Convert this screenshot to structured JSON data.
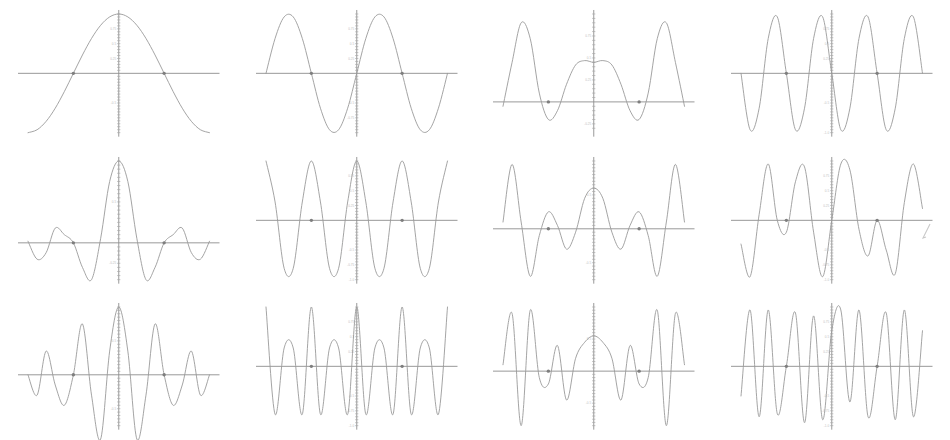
{
  "figure": {
    "title": "",
    "rows": 3,
    "columns": 4,
    "background_color": "#ffffff",
    "curve_color": "#9a9a9a",
    "axis_color": "#8d8d8d",
    "marker_color": "#7e7e7e",
    "ticklabel_color": "#c2c2c2",
    "stray_mark": {
      "name": "stray-pen-mark",
      "description": "small faint diagonal tick at far right of middle row"
    }
  },
  "chart_data": [
    {
      "type": "line",
      "title": "",
      "xlabel": "",
      "ylabel": "",
      "panel_index": 1,
      "row": 1,
      "column": 1,
      "function": "cos(x)",
      "harmonic": 1,
      "xlim": [
        -3.14159,
        3.14159
      ],
      "ylim": [
        -1.0,
        1.0
      ],
      "grid": false,
      "legend": null,
      "yticks": [
        -0.5,
        0.25,
        0.5,
        0.75
      ],
      "yticklabels": [
        "-0.5",
        "0.25",
        "0.5",
        "0.75"
      ],
      "markers": [
        {
          "x": -1.5708,
          "y": 0
        },
        {
          "x": 1.5708,
          "y": 0
        }
      ],
      "x": [
        -3.14159,
        -2.82743,
        -2.51327,
        -2.19911,
        -1.88496,
        -1.5708,
        -1.25664,
        -0.94248,
        -0.62832,
        -0.31416,
        0,
        0.31416,
        0.62832,
        0.94248,
        1.25664,
        1.5708,
        1.88496,
        2.19911,
        2.51327,
        2.82743,
        3.14159
      ],
      "values": [
        -1,
        -0.951,
        -0.809,
        -0.588,
        -0.309,
        0,
        0.309,
        0.588,
        0.809,
        0.951,
        1,
        0.951,
        0.809,
        0.588,
        0.309,
        0,
        -0.309,
        -0.588,
        -0.809,
        -0.951,
        -1
      ]
    },
    {
      "type": "line",
      "title": "",
      "xlabel": "",
      "ylabel": "",
      "panel_index": 2,
      "row": 1,
      "column": 2,
      "function": "sin(2x)",
      "harmonic": 2,
      "xlim": [
        -3.14159,
        3.14159
      ],
      "ylim": [
        -1.0,
        1.0
      ],
      "grid": false,
      "legend": null,
      "yticks": [
        -0.75,
        -0.5,
        0.25,
        0.5,
        0.75
      ],
      "yticklabels": [
        "-0.75",
        "-0.5",
        "0.25",
        "0.5",
        "0.75"
      ],
      "markers": [
        {
          "x": -1.5708,
          "y": 0
        },
        {
          "x": 1.5708,
          "y": 0
        }
      ],
      "x": [
        -3.14159,
        -2.82743,
        -2.51327,
        -2.19911,
        -1.88496,
        -1.5708,
        -1.25664,
        -0.94248,
        -0.62832,
        -0.31416,
        0,
        0.31416,
        0.62832,
        0.94248,
        1.25664,
        1.5708,
        1.88496,
        2.19911,
        2.51327,
        2.82743,
        3.14159
      ],
      "values": [
        0,
        0.588,
        0.951,
        0.951,
        0.588,
        0,
        -0.588,
        -0.951,
        -0.951,
        -0.588,
        0,
        0.588,
        0.951,
        0.951,
        0.588,
        0,
        -0.588,
        -0.951,
        -0.951,
        -0.588,
        0
      ]
    },
    {
      "type": "line",
      "title": "",
      "xlabel": "",
      "ylabel": "",
      "panel_index": 3,
      "row": 1,
      "column": 3,
      "function": "cos(3x)",
      "harmonic": 3,
      "xlim": [
        -3.14159,
        3.14159
      ],
      "ylim": [
        -0.35,
        1.0
      ],
      "grid": false,
      "legend": null,
      "yticks": [
        -0.25,
        0.25,
        0.5,
        0.75
      ],
      "yticklabels": [
        "-0.25",
        "0.25",
        "0.5",
        "0.75"
      ],
      "markers": [
        {
          "x": -1.5708,
          "y": 0
        },
        {
          "x": 1.5708,
          "y": 0
        }
      ],
      "x": [
        -3.14159,
        -2.82743,
        -2.51327,
        -2.19911,
        -1.88496,
        -1.5708,
        -1.25664,
        -0.94248,
        -0.62832,
        -0.31416,
        0,
        0.31416,
        0.62832,
        0.94248,
        1.25664,
        1.5708,
        1.88496,
        2.19911,
        2.51327,
        2.82743,
        3.14159
      ],
      "values": [
        -0.05,
        0.45,
        0.9,
        0.72,
        0.1,
        -0.2,
        -0.1,
        0.2,
        0.42,
        0.47,
        0.45,
        0.47,
        0.42,
        0.2,
        -0.1,
        -0.2,
        0.1,
        0.72,
        0.9,
        0.45,
        -0.05
      ]
    },
    {
      "type": "line",
      "title": "",
      "xlabel": "",
      "ylabel": "",
      "panel_index": 4,
      "row": 1,
      "column": 4,
      "function": "sin(4x)",
      "harmonic": 4,
      "xlim": [
        -3.14159,
        3.14159
      ],
      "ylim": [
        -1.0,
        1.0
      ],
      "grid": false,
      "legend": null,
      "yticks": [
        -1.0,
        -0.5,
        0.25,
        0.5,
        0.75
      ],
      "yticklabels": [
        "-1.0",
        "-0.5",
        "0.25",
        "0.5",
        "0.75"
      ],
      "markers": [
        {
          "x": -1.5708,
          "y": 0
        },
        {
          "x": 1.5708,
          "y": 0
        }
      ],
      "x": [
        -3.14159,
        -2.82743,
        -2.51327,
        -2.19911,
        -1.88496,
        -1.5708,
        -1.25664,
        -0.94248,
        -0.62832,
        -0.31416,
        0,
        0.31416,
        0.62832,
        0.94248,
        1.25664,
        1.5708,
        1.88496,
        2.19911,
        2.51327,
        2.82743,
        3.14159
      ],
      "values": [
        0,
        -0.951,
        -0.588,
        0.588,
        0.951,
        0,
        -0.951,
        -0.588,
        0.588,
        0.951,
        0,
        -0.951,
        -0.588,
        0.588,
        0.951,
        0,
        -0.951,
        -0.588,
        0.588,
        0.951,
        0
      ]
    },
    {
      "type": "line",
      "title": "",
      "xlabel": "",
      "ylabel": "",
      "panel_index": 5,
      "row": 2,
      "column": 1,
      "function": "dirichlet-kernel",
      "harmonic": 5,
      "xlim": [
        -3.14159,
        3.14159
      ],
      "ylim": [
        -0.45,
        1.0
      ],
      "grid": false,
      "legend": null,
      "yticks": [
        -0.25,
        0.5
      ],
      "yticklabels": [
        "-0.25",
        "0.5"
      ],
      "markers": [
        {
          "x": -1.5708,
          "y": 0
        },
        {
          "x": 1.5708,
          "y": 0
        }
      ],
      "x": [
        -3.14159,
        -2.82743,
        -2.51327,
        -2.19911,
        -1.88496,
        -1.5708,
        -1.25664,
        -0.94248,
        -0.62832,
        -0.31416,
        0,
        0.31416,
        0.62832,
        0.94248,
        1.25664,
        1.5708,
        1.88496,
        2.19911,
        2.51327,
        2.82743,
        3.14159
      ],
      "values": [
        0.02,
        -0.2,
        -0.12,
        0.18,
        0.1,
        0,
        -0.3,
        -0.45,
        0.05,
        0.75,
        1.0,
        0.75,
        0.05,
        -0.45,
        -0.3,
        0,
        0.1,
        0.18,
        -0.12,
        -0.2,
        0.02
      ]
    },
    {
      "type": "line",
      "title": "",
      "xlabel": "",
      "ylabel": "",
      "panel_index": 6,
      "row": 2,
      "column": 2,
      "function": "cos(6x)",
      "harmonic": 6,
      "xlim": [
        -3.14159,
        3.14159
      ],
      "ylim": [
        -1.0,
        1.0
      ],
      "grid": false,
      "legend": null,
      "yticks": [
        -1.0,
        -0.75,
        -0.5,
        0.25,
        0.5,
        0.75
      ],
      "yticklabels": [
        "-1.0",
        "-0.75",
        "-0.5",
        "0.25",
        "0.5",
        "0.75"
      ],
      "markers": [
        {
          "x": -1.5708,
          "y": 0
        },
        {
          "x": 1.5708,
          "y": 0
        }
      ],
      "x": [
        -3.14159,
        -2.82743,
        -2.51327,
        -2.19911,
        -1.88496,
        -1.5708,
        -1.25664,
        -0.94248,
        -0.62832,
        -0.31416,
        0,
        0.31416,
        0.62832,
        0.94248,
        1.25664,
        1.5708,
        1.88496,
        2.19911,
        2.51327,
        2.82743,
        3.14159
      ],
      "values": [
        1,
        0.309,
        -0.809,
        -0.809,
        0.309,
        1,
        0.309,
        -0.809,
        -0.809,
        0.309,
        1,
        0.309,
        -0.809,
        -0.809,
        0.309,
        1,
        0.309,
        -0.809,
        -0.809,
        0.309,
        1
      ]
    },
    {
      "type": "line",
      "title": "",
      "xlabel": "",
      "ylabel": "",
      "panel_index": 7,
      "row": 2,
      "column": 3,
      "function": "modulated-kernel",
      "harmonic": 7,
      "xlim": [
        -3.14159,
        3.14159
      ],
      "ylim": [
        -0.75,
        1.0
      ],
      "grid": false,
      "legend": null,
      "yticks": [
        -0.5,
        0.5
      ],
      "yticklabels": [
        "-0.5",
        "0.5"
      ],
      "markers": [
        {
          "x": -1.5708,
          "y": 0
        },
        {
          "x": 1.5708,
          "y": 0
        }
      ],
      "x": [
        -3.14159,
        -2.82743,
        -2.51327,
        -2.19911,
        -1.88496,
        -1.5708,
        -1.25664,
        -0.94248,
        -0.62832,
        -0.31416,
        0,
        0.31416,
        0.62832,
        0.94248,
        1.25664,
        1.5708,
        1.88496,
        2.19911,
        2.51327,
        2.82743,
        3.14159
      ],
      "values": [
        0.1,
        0.95,
        0.1,
        -0.7,
        -0.1,
        0.25,
        0.05,
        -0.3,
        -0.05,
        0.45,
        0.6,
        0.45,
        -0.05,
        -0.3,
        0.05,
        0.25,
        -0.1,
        -0.7,
        0.1,
        0.95,
        0.1
      ]
    },
    {
      "type": "line",
      "title": "",
      "xlabel": "",
      "ylabel": "",
      "panel_index": 8,
      "row": 2,
      "column": 4,
      "function": "sin(8x)-mixed",
      "harmonic": 8,
      "xlim": [
        -3.14159,
        3.14159
      ],
      "ylim": [
        -1.0,
        1.0
      ],
      "grid": false,
      "legend": null,
      "yticks": [
        -1.0,
        -0.75,
        -0.5,
        0.25,
        0.5,
        0.75
      ],
      "yticklabels": [
        "-1.0",
        "-0.75",
        "-0.5",
        "0.25",
        "0.5",
        "0.75"
      ],
      "markers": [
        {
          "x": -1.5708,
          "y": 0
        },
        {
          "x": 1.5708,
          "y": 0
        }
      ],
      "x": [
        -3.14159,
        -2.82743,
        -2.51327,
        -2.19911,
        -1.88496,
        -1.5708,
        -1.25664,
        -0.94248,
        -0.62832,
        -0.31416,
        0,
        0.31416,
        0.62832,
        0.94248,
        1.25664,
        1.5708,
        1.88496,
        2.19911,
        2.51327,
        2.82743,
        3.14159
      ],
      "values": [
        -0.4,
        -0.95,
        0.1,
        0.95,
        0.0,
        -0.2,
        0.65,
        0.9,
        -0.2,
        -0.95,
        0.0,
        0.95,
        0.85,
        -0.15,
        -0.6,
        0.0,
        -0.5,
        -0.9,
        0.3,
        0.95,
        0.2
      ]
    },
    {
      "type": "line",
      "title": "",
      "xlabel": "",
      "ylabel": "",
      "panel_index": 9,
      "row": 3,
      "column": 1,
      "function": "dirichlet-kernel",
      "harmonic": 9,
      "xlim": [
        -3.14159,
        3.14159
      ],
      "ylim": [
        -0.75,
        1.0
      ],
      "grid": false,
      "legend": null,
      "yticks": [
        -0.5,
        0.5
      ],
      "yticklabels": [
        "-0.5",
        "0.5"
      ],
      "markers": [
        {
          "x": -1.5708,
          "y": 0
        },
        {
          "x": 1.5708,
          "y": 0
        }
      ],
      "x": [
        -3.14159,
        -2.82743,
        -2.51327,
        -2.19911,
        -1.88496,
        -1.5708,
        -1.25664,
        -0.94248,
        -0.62832,
        -0.31416,
        0,
        0.31416,
        0.62832,
        0.94248,
        1.25664,
        1.5708,
        1.88496,
        2.19911,
        2.51327,
        2.82743,
        3.14159
      ],
      "values": [
        0.0,
        -0.3,
        0.35,
        -0.15,
        -0.45,
        0.0,
        0.75,
        -0.3,
        -0.95,
        0.35,
        1.0,
        0.35,
        -0.95,
        -0.3,
        0.75,
        0.0,
        -0.45,
        -0.15,
        0.35,
        -0.3,
        0.0
      ]
    },
    {
      "type": "line",
      "title": "",
      "xlabel": "",
      "ylabel": "",
      "panel_index": 10,
      "row": 3,
      "column": 2,
      "function": "cos(10x)",
      "harmonic": 10,
      "xlim": [
        -3.14159,
        3.14159
      ],
      "ylim": [
        -1.0,
        1.0
      ],
      "grid": false,
      "legend": null,
      "yticks": [
        -1.0,
        -0.75,
        -0.5,
        0.25,
        0.5,
        0.75
      ],
      "yticklabels": [
        "-1.0",
        "-0.75",
        "-0.5",
        "0.25",
        "0.5",
        "0.75"
      ],
      "markers": [
        {
          "x": -1.5708,
          "y": 0
        },
        {
          "x": 1.5708,
          "y": 0
        }
      ],
      "x": [
        -3.14159,
        -2.82743,
        -2.51327,
        -2.19911,
        -1.88496,
        -1.5708,
        -1.25664,
        -0.94248,
        -0.62832,
        -0.31416,
        0,
        0.31416,
        0.62832,
        0.94248,
        1.25664,
        1.5708,
        1.88496,
        2.19911,
        2.51327,
        2.82743,
        3.14159
      ],
      "values": [
        1,
        -0.809,
        0.309,
        0.309,
        -0.809,
        1,
        -0.809,
        0.309,
        0.309,
        -0.809,
        1,
        -0.809,
        0.309,
        0.309,
        -0.809,
        1,
        -0.809,
        0.309,
        0.309,
        -0.809,
        1
      ]
    },
    {
      "type": "line",
      "title": "",
      "xlabel": "",
      "ylabel": "",
      "panel_index": 11,
      "row": 3,
      "column": 3,
      "function": "modulated-kernel",
      "harmonic": 11,
      "xlim": [
        -3.14159,
        3.14159
      ],
      "ylim": [
        -0.85,
        1.0
      ],
      "grid": false,
      "legend": null,
      "yticks": [
        -0.5,
        0.5
      ],
      "yticklabels": [
        "-0.5",
        "0.5"
      ],
      "markers": [
        {
          "x": -1.5708,
          "y": 0
        },
        {
          "x": 1.5708,
          "y": 0
        }
      ],
      "x": [
        -3.14159,
        -2.82743,
        -2.51327,
        -2.19911,
        -1.88496,
        -1.5708,
        -1.25664,
        -0.94248,
        -0.62832,
        -0.31416,
        0,
        0.31416,
        0.62832,
        0.94248,
        1.25664,
        1.5708,
        1.88496,
        2.19911,
        2.51327,
        2.82743,
        3.14159
      ],
      "values": [
        0.1,
        0.9,
        -0.85,
        0.95,
        -0.1,
        -0.2,
        0.4,
        -0.45,
        0.2,
        0.45,
        0.55,
        0.45,
        0.2,
        -0.45,
        0.4,
        -0.2,
        -0.1,
        0.95,
        -0.85,
        0.9,
        0.1
      ]
    },
    {
      "type": "line",
      "title": "",
      "xlabel": "",
      "ylabel": "",
      "panel_index": 12,
      "row": 3,
      "column": 4,
      "function": "sin(12x)-mixed",
      "harmonic": 12,
      "xlim": [
        -3.14159,
        3.14159
      ],
      "ylim": [
        -1.0,
        1.0
      ],
      "grid": false,
      "legend": null,
      "yticks": [
        -1.0,
        -0.75,
        -0.5,
        0.25,
        0.5,
        0.75
      ],
      "yticklabels": [
        "-1.0",
        "-0.75",
        "-0.5",
        "0.25",
        "0.5",
        "0.75"
      ],
      "markers": [
        {
          "x": -1.5708,
          "y": 0
        },
        {
          "x": 1.5708,
          "y": 0
        }
      ],
      "x": [
        -3.14159,
        -2.82743,
        -2.51327,
        -2.19911,
        -1.88496,
        -1.5708,
        -1.25664,
        -0.94248,
        -0.62832,
        -0.31416,
        0,
        0.31416,
        0.62832,
        0.94248,
        1.25664,
        1.5708,
        1.88496,
        2.19911,
        2.51327,
        2.82743,
        3.14159
      ],
      "values": [
        -0.5,
        0.95,
        -0.85,
        0.95,
        -0.8,
        0.0,
        0.9,
        -0.95,
        0.85,
        -0.9,
        0.6,
        0.95,
        -0.6,
        0.95,
        -0.85,
        0.0,
        0.9,
        -0.9,
        0.95,
        -0.85,
        0.6
      ]
    }
  ]
}
